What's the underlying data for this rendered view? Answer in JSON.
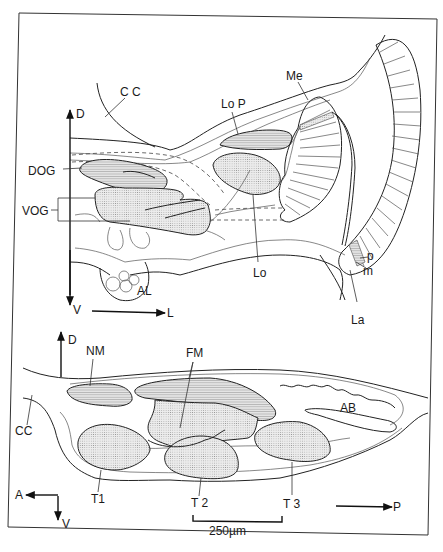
{
  "figure": {
    "upper_panel": {
      "name": "optic lobe frontal section",
      "labels": {
        "cc": "C C",
        "lop": "Lo P",
        "me": "Me",
        "dog": "DOG",
        "vog": "VOG",
        "lo": "Lo",
        "al": "AL",
        "la": "La",
        "p": "p",
        "m": "m"
      },
      "axes": {
        "up": "D",
        "down": "V",
        "right": "L"
      }
    },
    "lower_panel": {
      "name": "thoracic ganglia sagittal section",
      "labels": {
        "nm": "NM",
        "fm": "FM",
        "ab": "AB",
        "cc": "CC",
        "t1": "T1",
        "t2": "T 2",
        "t3": "T 3"
      },
      "axes": {
        "up": "D",
        "left": "A",
        "down": "V",
        "right": "P"
      },
      "scale_bar": "250µm"
    }
  }
}
